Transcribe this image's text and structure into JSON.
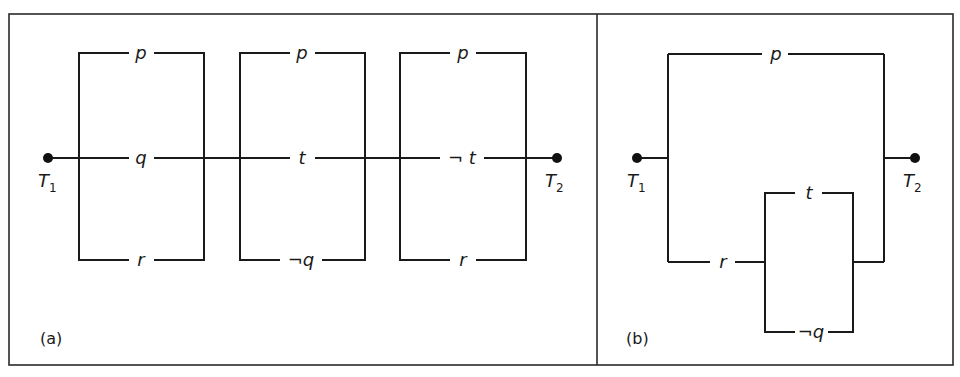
{
  "figure": {
    "panels": [
      {
        "id": "a",
        "caption": "(a)",
        "terminals": {
          "left": {
            "name": "T",
            "sub": "1"
          },
          "right": {
            "name": "T",
            "sub": "2"
          }
        },
        "description": "Three parallel blocks connected in series between T1 and T2",
        "blocks": [
          {
            "top": "p",
            "middle": "q",
            "bottom": "r"
          },
          {
            "top": "p",
            "middle": "t",
            "bottom": "¬q"
          },
          {
            "top": "p",
            "middle": "¬ t",
            "bottom": "r"
          }
        ]
      },
      {
        "id": "b",
        "caption": "(b)",
        "terminals": {
          "left": {
            "name": "T",
            "sub": "1"
          },
          "right": {
            "name": "T",
            "sub": "2"
          }
        },
        "description": "Switch p in parallel with r in series with (t parallel ¬q)",
        "upper_branch": "p",
        "lower_branch": {
          "series": "r",
          "parallel_top": "t",
          "parallel_bottom": "¬q"
        }
      }
    ]
  }
}
